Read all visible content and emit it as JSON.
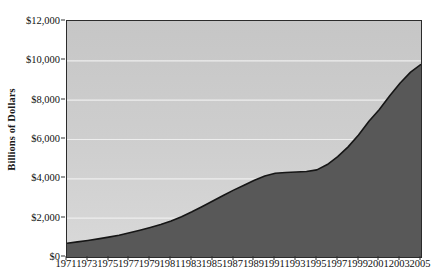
{
  "chart_data": {
    "type": "area",
    "title": "",
    "xlabel": "",
    "ylabel": "Billions of Dollars",
    "ylim": [
      0,
      12000
    ],
    "xlim": [
      1971,
      2005
    ],
    "grid": true,
    "legend": null,
    "y_ticks": [
      {
        "value": 0,
        "label": "$0"
      },
      {
        "value": 2000,
        "label": "$2,000"
      },
      {
        "value": 4000,
        "label": "$4,000"
      },
      {
        "value": 6000,
        "label": "$6,000"
      },
      {
        "value": 8000,
        "label": "$8,000"
      },
      {
        "value": 10000,
        "label": "$10,000"
      },
      {
        "value": 12000,
        "label": "$12,000"
      }
    ],
    "x_ticks": [
      "1971",
      "1973",
      "1975",
      "1977",
      "1979",
      "1981",
      "1983",
      "1985",
      "1987",
      "1989",
      "1991",
      "1993",
      "1995",
      "1997",
      "1999",
      "2001",
      "2003",
      "2005"
    ],
    "x": [
      1971,
      1972,
      1973,
      1974,
      1975,
      1976,
      1977,
      1978,
      1979,
      1980,
      1981,
      1982,
      1983,
      1984,
      1985,
      1986,
      1987,
      1988,
      1989,
      1990,
      1991,
      1992,
      1993,
      1994,
      1995,
      1996,
      1997,
      1998,
      1999,
      2000,
      2001,
      2002,
      2003,
      2004,
      2005
    ],
    "values": [
      700,
      770,
      840,
      920,
      1010,
      1110,
      1230,
      1360,
      1500,
      1650,
      1830,
      2050,
      2300,
      2570,
      2850,
      3130,
      3400,
      3650,
      3900,
      4120,
      4260,
      4300,
      4320,
      4350,
      4430,
      4700,
      5100,
      5600,
      6200,
      6900,
      7500,
      8200,
      8850,
      9400,
      9800
    ],
    "colors": {
      "area_fill": "#585858",
      "plot_background_top": "#c6c6c6",
      "plot_background_bottom": "#d9d9d9",
      "line": "#161616",
      "gridline": "#eeeeee",
      "axis": "#2b2b2b",
      "text": "#111111"
    }
  }
}
